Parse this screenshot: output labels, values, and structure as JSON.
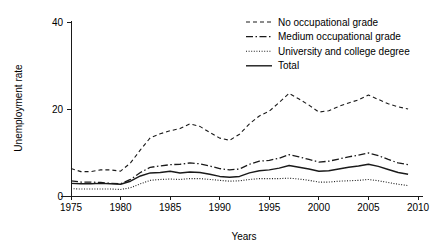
{
  "chart_data": {
    "type": "line",
    "title": "",
    "xlabel": "Years",
    "ylabel": "Unemployment rate",
    "xlim": [
      1974,
      2010.5
    ],
    "ylim": [
      0,
      40
    ],
    "xticks": [
      1975,
      1980,
      1985,
      1990,
      1995,
      2000,
      2005,
      2010
    ],
    "yticks": [
      0,
      20,
      40
    ],
    "grid": false,
    "legend_position": "top-right",
    "x": [
      1975,
      1976,
      1977,
      1978,
      1979,
      1980,
      1981,
      1982,
      1983,
      1984,
      1985,
      1986,
      1987,
      1988,
      1989,
      1990,
      1991,
      1992,
      1993,
      1994,
      1995,
      1996,
      1997,
      1998,
      1999,
      2000,
      2001,
      2002,
      2003,
      2004,
      2005,
      2006,
      2007,
      2008,
      2009
    ],
    "series": [
      {
        "name": "No occupational grade",
        "dash": "4,3",
        "width": 1.1,
        "values": [
          6.3,
          5.6,
          5.6,
          6.0,
          6.0,
          5.7,
          7.6,
          10.6,
          13.4,
          14.3,
          15.0,
          15.5,
          16.6,
          16.0,
          14.6,
          13.3,
          12.8,
          14.2,
          16.6,
          18.4,
          19.5,
          21.5,
          23.6,
          22.3,
          20.9,
          19.3,
          19.6,
          20.6,
          21.4,
          22.1,
          23.2,
          22.2,
          21.2,
          20.5,
          20.0
        ]
      },
      {
        "name": "Medium occupational grade",
        "dash": "7,2.5,1.5,2.5",
        "width": 1.3,
        "values": [
          3.5,
          3.2,
          3.2,
          3.1,
          2.9,
          2.8,
          3.8,
          5.4,
          6.6,
          6.9,
          7.2,
          7.3,
          7.6,
          7.4,
          6.9,
          6.3,
          6.0,
          6.2,
          7.3,
          8.0,
          8.2,
          8.7,
          9.5,
          9.0,
          8.4,
          7.8,
          8.0,
          8.5,
          9.0,
          9.4,
          9.9,
          9.3,
          8.4,
          7.6,
          7.2
        ]
      },
      {
        "name": "University and college degree",
        "dash": "1,1.6",
        "width": 1.1,
        "values": [
          1.7,
          1.6,
          1.6,
          1.6,
          1.6,
          1.5,
          1.9,
          2.8,
          3.6,
          3.8,
          3.9,
          3.8,
          4.0,
          4.0,
          3.8,
          3.6,
          3.4,
          3.5,
          3.8,
          4.0,
          4.0,
          4.0,
          4.1,
          3.9,
          3.6,
          3.2,
          3.2,
          3.4,
          3.5,
          3.6,
          3.8,
          3.5,
          3.1,
          2.7,
          2.4
        ]
      },
      {
        "name": "Total",
        "dash": "",
        "width": 1.4,
        "values": [
          2.9,
          2.8,
          2.8,
          2.9,
          2.8,
          2.7,
          3.4,
          4.6,
          5.3,
          5.4,
          5.7,
          5.3,
          5.5,
          5.4,
          5.0,
          4.5,
          4.3,
          4.5,
          5.3,
          5.8,
          6.0,
          6.4,
          7.0,
          6.6,
          6.2,
          5.7,
          5.8,
          6.2,
          6.6,
          6.9,
          7.3,
          6.8,
          6.1,
          5.4,
          5.0
        ]
      }
    ]
  }
}
